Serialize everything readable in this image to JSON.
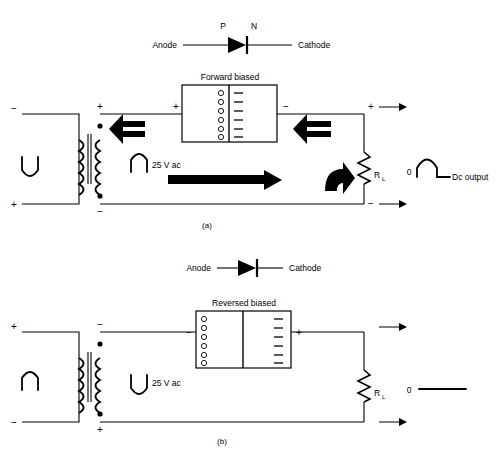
{
  "figure": {
    "panel_a_label": "(a)",
    "panel_b_label": "(b)"
  },
  "diode_symbol_a": {
    "anode_label": "Anode",
    "cathode_label": "Cathode",
    "p_label": "P",
    "n_label": "N"
  },
  "diode_symbol_b": {
    "anode_label": "Anode",
    "cathode_label": "Cathode"
  },
  "panel_a": {
    "bias_box_title": "Forward biased",
    "bias_box_left_sign": "+",
    "bias_box_right_sign": "−",
    "holes_count": 6,
    "electrons_count": 6,
    "source_label": "25 V ac",
    "load_label": "R",
    "load_label_sub": "L",
    "output_zero_label": "0",
    "output_label": "Dc output",
    "primary_top_sign": "−",
    "primary_bottom_sign": "+",
    "secondary_top_sign": "+",
    "secondary_bottom_sign": "−",
    "output_top_sign": "+",
    "output_bottom_sign": "−",
    "current_direction_top": "left",
    "current_direction_bottom": "right",
    "primary_waveform": "negative-half-u",
    "secondary_waveform": "positive-half-arch",
    "output_waveform": "half-sine-pulse"
  },
  "panel_b": {
    "bias_box_title": "Reversed biased",
    "bias_box_left_sign": "−",
    "bias_box_right_sign": "+",
    "holes_count": 6,
    "electrons_count": 6,
    "source_label": "25 V ac",
    "load_label": "R",
    "load_label_sub": "L",
    "output_zero_label": "0",
    "primary_top_sign": "+",
    "primary_bottom_sign": "−",
    "secondary_top_sign": "−",
    "secondary_bottom_sign": "+",
    "output_top_sign": "",
    "output_bottom_sign": "",
    "primary_waveform": "positive-half-arch",
    "secondary_waveform": "negative-half-u",
    "output_waveform": "flat-zero-line"
  },
  "colors": {
    "ink": "#000000",
    "background": "#ffffff"
  }
}
